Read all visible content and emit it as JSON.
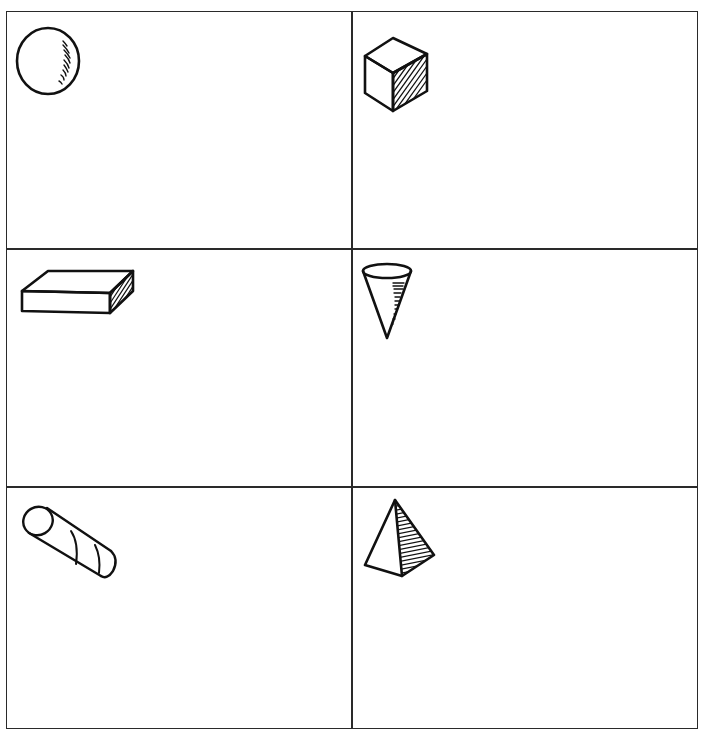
{
  "worksheet": {
    "layout": {
      "rows": 3,
      "columns": 2
    },
    "colors": {
      "line": "#111111",
      "grid": "#2a2a2a",
      "background": "#ffffff"
    },
    "cells": [
      {
        "position": "row-1-col-1",
        "shape": "sphere",
        "icon": "sphere-icon"
      },
      {
        "position": "row-1-col-2",
        "shape": "cube",
        "icon": "cube-icon"
      },
      {
        "position": "row-2-col-1",
        "shape": "rectangular prism",
        "icon": "rectangular-prism-icon"
      },
      {
        "position": "row-2-col-2",
        "shape": "cone",
        "icon": "cone-icon"
      },
      {
        "position": "row-3-col-1",
        "shape": "cylinder",
        "icon": "cylinder-icon"
      },
      {
        "position": "row-3-col-2",
        "shape": "pyramid",
        "icon": "pyramid-icon"
      }
    ]
  }
}
